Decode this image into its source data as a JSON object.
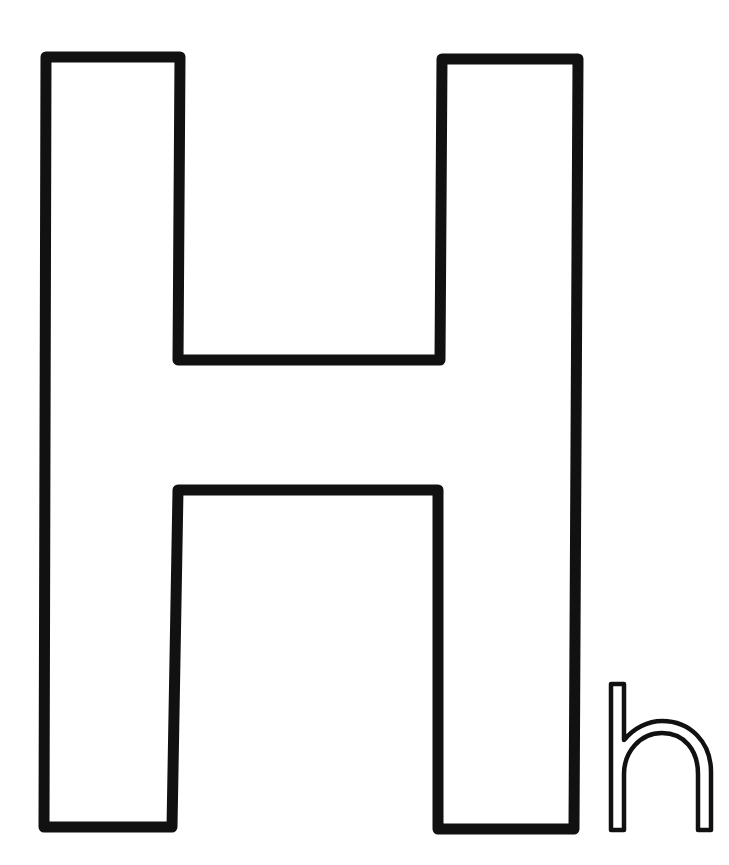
{
  "page": {
    "kind": "coloring-page",
    "uppercase_letter": "H",
    "lowercase_letter": "h"
  },
  "colors": {
    "background": "#ffffff",
    "outline": "#111111"
  }
}
